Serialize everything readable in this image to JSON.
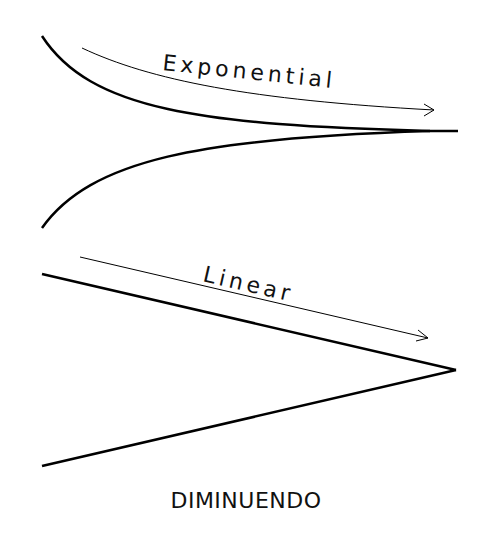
{
  "diagram": {
    "title": "DIMINUENDO",
    "panels": [
      {
        "label": "Exponential",
        "shape": "curved hairpin converging to a point",
        "arrow": "points right"
      },
      {
        "label": "Linear",
        "shape": "straight-line hairpin converging to a point",
        "arrow": "points right"
      }
    ],
    "colors": {
      "stroke": "#000000",
      "background": "#ffffff"
    }
  }
}
